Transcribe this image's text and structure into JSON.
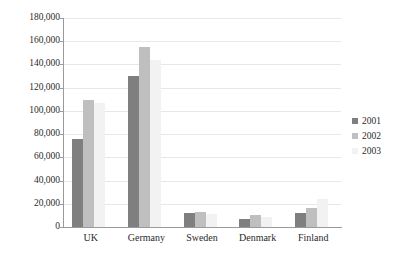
{
  "chart_data": {
    "type": "bar",
    "title": "",
    "subtitle": "",
    "xlabel": "",
    "ylabel": "",
    "categories": [
      "UK",
      "Germany",
      "Sweden",
      "Denmark",
      "Finland"
    ],
    "series": [
      {
        "name": "2001",
        "color": "#7f7f7f",
        "values": [
          76000,
          130000,
          12000,
          7000,
          12000
        ]
      },
      {
        "name": "2002",
        "color": "#bfbfbf",
        "values": [
          109000,
          155000,
          13000,
          10000,
          16000
        ]
      },
      {
        "name": "2003",
        "color": "#f2f2f2",
        "values": [
          107000,
          144000,
          11000,
          9000,
          24000
        ]
      }
    ],
    "ylim": [
      0,
      180000
    ],
    "yticks": [
      0,
      20000,
      40000,
      60000,
      80000,
      100000,
      120000,
      140000,
      160000,
      180000
    ],
    "ytick_labels": [
      "0",
      "20,000",
      "40,000",
      "60,000",
      "80,000",
      "100,000",
      "120,000",
      "140,000",
      "160,000",
      "180,000"
    ],
    "grid": true,
    "legend_position": "right"
  },
  "legend": {
    "entries": [
      {
        "label": "2001",
        "swatch": "legend-swatch-2001"
      },
      {
        "label": "2002",
        "swatch": "legend-swatch-2002"
      },
      {
        "label": "2003",
        "swatch": "legend-swatch-2003"
      }
    ]
  }
}
